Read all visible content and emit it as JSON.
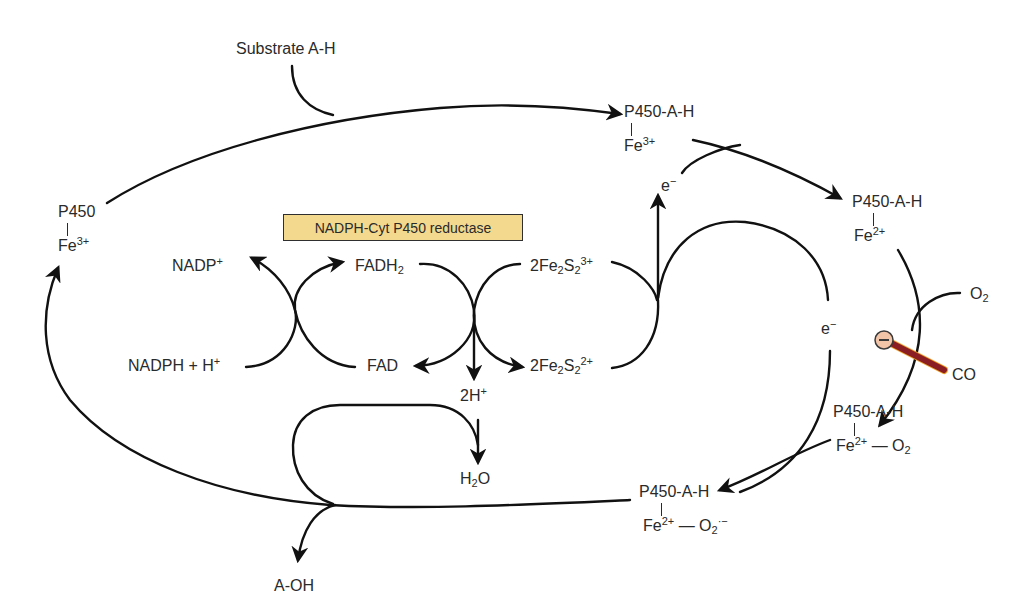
{
  "diagram": {
    "enzyme_box": {
      "label": "NADPH-Cyt P450 reductase",
      "fill": "#f3d98e",
      "border": "#2f2f2f"
    },
    "cycle_states": [
      {
        "id": "p450_fe3",
        "top": "P450",
        "bottom_base": "Fe",
        "bottom_sup": "3+",
        "bottom_tail": ""
      },
      {
        "id": "p450_ah_fe3",
        "top": "P450-A-H",
        "bottom_base": "Fe",
        "bottom_sup": "3+",
        "bottom_tail": ""
      },
      {
        "id": "p450_ah_fe2",
        "top": "P450-A-H",
        "bottom_base": "Fe",
        "bottom_sup": "2+",
        "bottom_tail": ""
      },
      {
        "id": "p450_ah_fe2_o2",
        "top": "P450-A-H",
        "bottom_base": "Fe",
        "bottom_sup": "2+",
        "bottom_tail": " — O",
        "bottom_tail_sub": "2"
      },
      {
        "id": "p450_ah_fe2_o2_superoxide",
        "top": "P450-A-H",
        "bottom_base": "Fe",
        "bottom_sup": "2+",
        "bottom_tail": " — O",
        "bottom_tail_sub": "2",
        "bottom_tail_sup": "·−"
      }
    ],
    "inputs_outputs": {
      "substrate": "Substrate A-H",
      "product": "A-OH",
      "oxygen_base": "O",
      "oxygen_sub": "2",
      "inhibitor": "CO",
      "electron_1_base": "e",
      "electron_1_sup": "−",
      "electron_2_base": "e",
      "electron_2_sup": "−",
      "protons_base": "2H",
      "protons_sup": "+",
      "water_base": "H",
      "water_sub": "2",
      "water_tail": "O"
    },
    "reductase_chain": {
      "nadp_base": "NADP",
      "nadp_sup": "+",
      "nadph_text": "NADPH + H",
      "nadph_sup": "+",
      "fadh2_base": "FADH",
      "fadh2_sub": "2",
      "fad": "FAD",
      "fes_ox": {
        "pre": "2Fe",
        "sub1": "2",
        "mid": "S",
        "sub2": "2",
        "sup": "3+"
      },
      "fes_red": {
        "pre": "2Fe",
        "sub1": "2",
        "mid": "S",
        "sub2": "2",
        "sup": "2+"
      }
    },
    "inhibition_symbol": {
      "glyph": "−",
      "circle_fill": "#f2c4a8",
      "bar_color": "#8b1e24",
      "bar_edge": "#f0a020"
    },
    "line_color": "#111111"
  }
}
